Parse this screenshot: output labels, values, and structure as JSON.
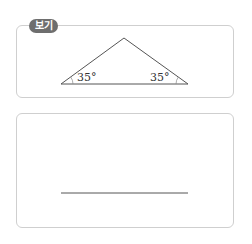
{
  "example": {
    "tag_label": "보기",
    "triangle": {
      "left_angle": "35°",
      "right_angle": "35°"
    }
  },
  "work_area": {
    "baseline": true
  },
  "colors": {
    "tag_bg": "#6e6e6e",
    "border": "#cfcfcf",
    "line": "#555555"
  }
}
